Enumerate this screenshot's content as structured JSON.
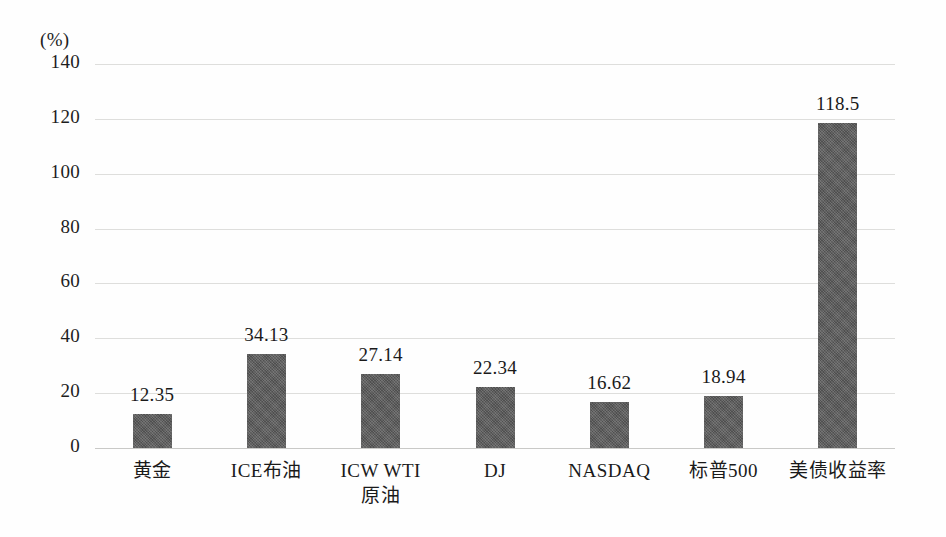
{
  "chart_data": {
    "type": "bar",
    "title": "",
    "subtitle": "",
    "xlabel": "",
    "ylabel": "",
    "unit_label": "(%)",
    "ylim": [
      0,
      140
    ],
    "ytick_step": 20,
    "yticks": [
      "140",
      "120",
      "100",
      "80",
      "60",
      "40",
      "20",
      "0"
    ],
    "grid": true,
    "legend": false,
    "legend_position": "none",
    "bar_color": "#585858",
    "gridline_color": "#dededc",
    "categories": [
      "黄金",
      "ICE布油",
      "ICW WTI原油",
      "DJ",
      "NASDAQ",
      "标普500",
      "美债收益率"
    ],
    "category_lines": [
      [
        "黄金"
      ],
      [
        "ICE布油"
      ],
      [
        "ICW WTI",
        "原油"
      ],
      [
        "DJ"
      ],
      [
        "NASDAQ"
      ],
      [
        "标普500"
      ],
      [
        "美债收益率"
      ]
    ],
    "values": [
      12.35,
      34.13,
      27.14,
      22.34,
      16.62,
      18.94,
      118.5
    ],
    "value_labels": [
      "12.35",
      "34.13",
      "27.14",
      "22.34",
      "16.62",
      "18.94",
      "118.5"
    ]
  }
}
